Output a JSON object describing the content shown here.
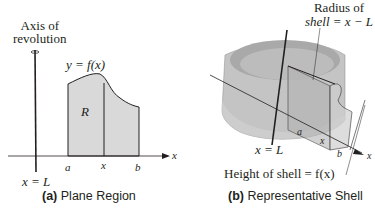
{
  "panel_a": {
    "axis_label_line1": "Axis of",
    "axis_label_line2": "revolution",
    "curve_label": "y = f(x)",
    "region_label": "R",
    "tick_a": "a",
    "tick_x": "x",
    "tick_b": "b",
    "x_axis_label": "x",
    "axis_equation": "x = L",
    "caption_letter": "(a)",
    "caption_text": "Plane Region"
  },
  "panel_b": {
    "radius_label_line1": "Radius of",
    "radius_label_line2": "shell = x − L",
    "tick_a": "a",
    "tick_x": "x",
    "tick_b": "b",
    "x_axis_label": "x",
    "axis_equation": "x = L",
    "height_label": "Height of shell = f(x)",
    "caption_letter": "(b)",
    "caption_text": "Representative Shell"
  },
  "colors": {
    "region_fill": "#d9d9d9",
    "shell_fill": "#bdbdbd",
    "line": "#231f20"
  }
}
